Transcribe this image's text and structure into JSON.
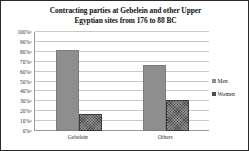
{
  "chart_data": {
    "type": "bar",
    "title": "Contracting parties at Gebelein and other Upper Egyptian sites from 176 to 88 BC",
    "title_line1": "Contracting parties at Gebelein and other Upper",
    "title_line2": "Egyptian sites from 176 to 88 BC",
    "xlabel": "",
    "ylabel": "",
    "categories": [
      "Gebelein",
      "Others"
    ],
    "series": [
      {
        "name": "Men",
        "values": [
          82,
          67
        ],
        "color": "#8e8e8e"
      },
      {
        "name": "Women",
        "values": [
          17,
          31
        ],
        "color": "#4a4a4a"
      }
    ],
    "ylim": [
      0,
      100
    ],
    "ytick_values": [
      0,
      10,
      20,
      30,
      40,
      50,
      60,
      70,
      80,
      90,
      100
    ],
    "ytick_labels": [
      "0%",
      "10%",
      "20%",
      "30%",
      "40%",
      "50%",
      "60%",
      "70%",
      "80%",
      "90%",
      "100%"
    ],
    "grid": true,
    "legend_position": "right",
    "value_suffix": "%"
  }
}
